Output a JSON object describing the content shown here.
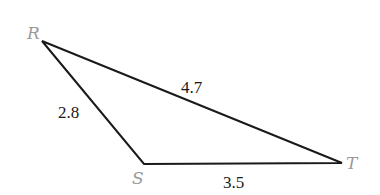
{
  "diagram": {
    "type": "triangle",
    "vertices": [
      {
        "label": "R",
        "x": 42,
        "y": 41
      },
      {
        "label": "S",
        "x": 144,
        "y": 164
      },
      {
        "label": "T",
        "x": 342,
        "y": 163
      }
    ],
    "sides": [
      {
        "name": "RS",
        "length": "2.8"
      },
      {
        "name": "RT",
        "length": "4.7"
      },
      {
        "name": "ST",
        "length": "3.5"
      }
    ],
    "colors": {
      "line": "#1a1a1a",
      "vertex_label": "#9a9a9a",
      "side_label": "#1a1a1a"
    }
  }
}
